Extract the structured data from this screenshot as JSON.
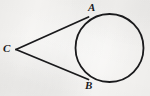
{
  "figure": {
    "kind": "geometry-diagram",
    "canvas": {
      "width": 150,
      "height": 96
    },
    "background_color": "#f5f4f2",
    "ink_color": "#1a1a1c",
    "stroke_width": 1.8,
    "circle": {
      "name": "circle",
      "center_x": 109.5,
      "center_y": 48.0,
      "radius": 34.0
    },
    "points": [
      {
        "id": "A",
        "label": "A",
        "x": 88.0,
        "y": 17.5,
        "role": "tangent-point-upper",
        "label_x": 88,
        "label_y": 2
      },
      {
        "id": "B",
        "label": "B",
        "x": 88.0,
        "y": 79.0,
        "role": "tangent-point-lower",
        "label_x": 85,
        "label_y": 80
      },
      {
        "id": "C",
        "label": "C",
        "x": 16.0,
        "y": 49.5,
        "role": "external-vertex",
        "label_x": 3,
        "label_y": 43
      }
    ],
    "segments": [
      {
        "id": "CA",
        "name": "tangent-segment-ca",
        "from": "C",
        "to": "A",
        "x1": 16.0,
        "y1": 49.5,
        "x2": 88.5,
        "y2": 17.0
      },
      {
        "id": "CB",
        "name": "tangent-segment-cb",
        "from": "C",
        "to": "B",
        "x1": 16.0,
        "y1": 49.5,
        "x2": 88.5,
        "y2": 79.5
      }
    ]
  }
}
